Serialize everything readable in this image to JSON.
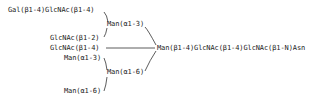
{
  "diagram": {
    "type": "glycan-structure",
    "labels": {
      "gal_glcnac_b14": "Gal(β1-4)GlcNAc(β1-4)",
      "man_a13_upper": "Man(α1-3)",
      "glcnac_b12": "GlcNAc(β1-2)",
      "glcnac_b14_bisect": "GlcNAc(β1-4)",
      "core": "Man(β1-4)GlcNAc(β1-4)GlcNAc(β1-N)Asn",
      "man_a13_lower": "Man(α1-3)",
      "man_a16_mid": "Man(α1-6)",
      "man_a16_bottom": "Man(α1-6)"
    },
    "line_color": "#333333",
    "text_color": "#222222"
  }
}
